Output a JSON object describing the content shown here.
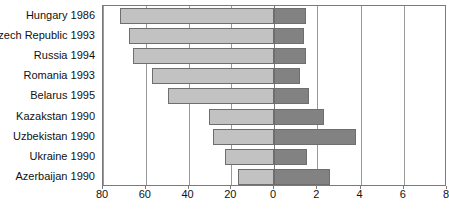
{
  "chart_data": {
    "type": "bar",
    "orientation": "horizontal",
    "layout": "bidirectional-butterfly",
    "title": "",
    "subtitle": "",
    "xlabel": "",
    "ylabel": "",
    "grid": true,
    "legend_position": "none",
    "categories": [
      "Hungary 1986",
      "Czech Republic 1993",
      "Russia 1994",
      "Romania 1993",
      "Belarus 1995",
      "Kazakstan 1990",
      "Uzbekistan 1990",
      "Ukraine 1990",
      "Azerbaijan 1990"
    ],
    "axes": {
      "left": {
        "ticks": [
          80,
          60,
          40,
          20,
          0
        ],
        "tick_labels": [
          "80",
          "60",
          "40",
          "20",
          "0"
        ],
        "range": [
          80,
          0
        ],
        "direction": "right-to-left"
      },
      "right": {
        "ticks": [
          0,
          2,
          4,
          6,
          8
        ],
        "tick_labels": [
          "0",
          "2",
          "4",
          "6",
          "8"
        ],
        "range": [
          0,
          8
        ],
        "direction": "left-to-right"
      }
    },
    "series": [
      {
        "name": "left-series",
        "side": "left",
        "color": "#c2c2c2",
        "values": [
          72.0,
          68.0,
          66.0,
          57.0,
          49.5,
          30.5,
          28.5,
          23.0,
          17.0
        ]
      },
      {
        "name": "right-series",
        "side": "right",
        "color": "#828282",
        "values": [
          1.48,
          1.37,
          1.5,
          1.22,
          1.62,
          2.32,
          3.8,
          1.52,
          2.58
        ]
      }
    ]
  },
  "style": {
    "bar_left_color": "#c2c2c2",
    "bar_right_color": "#828282",
    "bar_border_color": "#6e6e6e",
    "grid_color": "#9a9a9a",
    "axis_color": "#7a7a7a",
    "text_color": "#111111",
    "background": "#ffffff"
  }
}
